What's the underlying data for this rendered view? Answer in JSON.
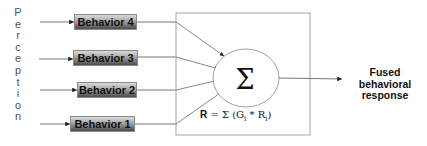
{
  "perception_label": {
    "text": "Perception",
    "letters": [
      "P",
      "e",
      "r",
      "c",
      "e",
      "p",
      "t",
      "i",
      "o",
      "n"
    ]
  },
  "behaviors": [
    {
      "label": "Behavior 4"
    },
    {
      "label": "Behavior 3"
    },
    {
      "label": "Behavior 2"
    },
    {
      "label": "Behavior 1"
    }
  ],
  "fusion": {
    "symbol": "Σ",
    "formula": {
      "lhs": "R",
      "eq": " = Σ (G",
      "sub_g": "i",
      "mult": " * R",
      "sub_r": "i",
      "close": ")"
    }
  },
  "output": {
    "line1": "Fused",
    "line2": "behavioral",
    "line3": "response"
  },
  "colors": {
    "line": "#555555",
    "frame": "#9a9a9a",
    "text": "#111111"
  }
}
